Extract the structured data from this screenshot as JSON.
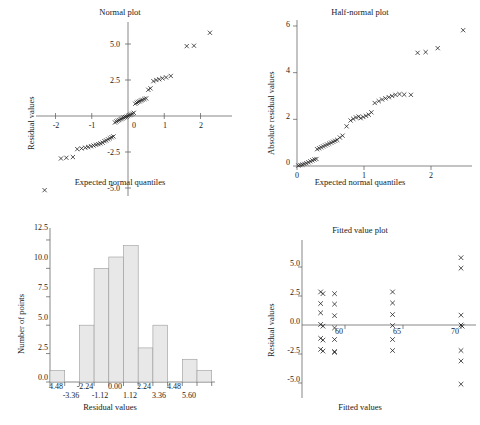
{
  "figure": {
    "panels": [
      {
        "id": "normal-plot",
        "title": "Normal plot",
        "xlabel": "Expected normal quantiles",
        "ylabel": "Residual values"
      },
      {
        "id": "half-normal-plot",
        "title": "Half-normal plot",
        "xlabel": "Expected normal quantiles",
        "ylabel": "Absolute residual values"
      },
      {
        "id": "histogram-plot",
        "title": "",
        "xlabel": "Residual values",
        "ylabel": "Number of points"
      },
      {
        "id": "fitted-value-plot",
        "title": "Fitted value plot",
        "xlabel": "Fitted values",
        "ylabel": "Residual values"
      }
    ]
  },
  "chart_data": [
    {
      "type": "scatter",
      "id": "normal-plot",
      "title": "Normal plot",
      "xlabel": "Expected normal quantiles",
      "ylabel": "Residual values",
      "xlim": [
        -2.6,
        2.6
      ],
      "ylim": [
        -5.6,
        6.2
      ],
      "xticks": [
        -2,
        -1,
        0,
        1,
        2
      ],
      "xtick_labels": [
        "-2",
        "-1",
        "0",
        "1",
        "2"
      ],
      "yticks": [
        -5.0,
        -2.5,
        0,
        2.5,
        5.0
      ],
      "ytick_labels": [
        "-5.0",
        "-2.5",
        "0",
        "2.5",
        "5.0"
      ],
      "grid": false,
      "legend": "none",
      "marker": "x",
      "x": [
        -2.3,
        -1.85,
        -1.7,
        -1.52,
        -1.4,
        -1.28,
        -1.18,
        -1.1,
        -1.02,
        -0.95,
        -0.88,
        -0.82,
        -0.76,
        -0.7,
        -0.65,
        -0.6,
        -0.55,
        -0.5,
        -0.45,
        -0.4,
        -0.36,
        -0.32,
        -0.28,
        -0.24,
        -0.2,
        -0.16,
        -0.12,
        -0.08,
        -0.04,
        0.0,
        0.04,
        0.08,
        0.12,
        0.16,
        0.2,
        0.24,
        0.28,
        0.32,
        0.36,
        0.4,
        0.45,
        0.5,
        0.56,
        0.62,
        0.7,
        0.78,
        0.86,
        0.95,
        1.05,
        1.18,
        1.62,
        1.82,
        2.26
      ],
      "y": [
        -5.15,
        -2.95,
        -2.9,
        -2.85,
        -2.3,
        -2.25,
        -2.2,
        -2.15,
        -2.1,
        -2.05,
        -2.0,
        -1.95,
        -1.9,
        -1.85,
        -1.75,
        -1.7,
        -1.62,
        -1.55,
        -1.48,
        -1.42,
        -0.45,
        -0.38,
        -0.32,
        -0.28,
        -0.22,
        -0.18,
        -0.12,
        -0.08,
        -0.04,
        0.02,
        0.06,
        0.1,
        0.16,
        0.22,
        0.85,
        0.92,
        0.98,
        1.02,
        1.08,
        1.12,
        1.18,
        1.22,
        1.82,
        1.92,
        2.42,
        2.5,
        2.55,
        2.62,
        2.68,
        2.78,
        4.85,
        4.88,
        5.78
      ]
    },
    {
      "type": "scatter",
      "id": "half-normal-plot",
      "title": "Half-normal plot",
      "xlabel": "Expected normal quantiles",
      "ylabel": "Absolute residual values",
      "xlim": [
        -0.1,
        2.75
      ],
      "ylim": [
        -0.2,
        6.4
      ],
      "xticks": [
        0,
        1,
        2
      ],
      "xtick_labels": [
        "0",
        "1",
        "2"
      ],
      "yticks": [
        0,
        2,
        4,
        6
      ],
      "ytick_labels": [
        "0",
        "2",
        "4",
        "6"
      ],
      "grid": false,
      "legend": "none",
      "marker": "x",
      "x": [
        0.02,
        0.05,
        0.08,
        0.11,
        0.14,
        0.17,
        0.2,
        0.23,
        0.26,
        0.29,
        0.3,
        0.33,
        0.36,
        0.39,
        0.42,
        0.45,
        0.48,
        0.51,
        0.54,
        0.57,
        0.6,
        0.64,
        0.68,
        0.74,
        0.8,
        0.84,
        0.88,
        0.92,
        0.95,
        0.99,
        1.03,
        1.07,
        1.11,
        1.16,
        1.22,
        1.27,
        1.32,
        1.37,
        1.42,
        1.47,
        1.53,
        1.6,
        1.7,
        1.8,
        1.92,
        2.1,
        2.48
      ],
      "y": [
        0.02,
        0.04,
        0.06,
        0.09,
        0.12,
        0.16,
        0.2,
        0.24,
        0.28,
        0.3,
        0.72,
        0.76,
        0.8,
        0.84,
        0.88,
        0.92,
        0.96,
        1.0,
        1.04,
        1.08,
        1.12,
        1.22,
        1.3,
        1.7,
        1.95,
        2.02,
        2.08,
        2.12,
        2.05,
        2.1,
        2.15,
        2.2,
        2.3,
        2.7,
        2.78,
        2.85,
        2.9,
        2.95,
        3.0,
        3.05,
        3.08,
        3.06,
        3.05,
        4.85,
        4.88,
        5.05,
        5.82
      ]
    },
    {
      "type": "bar",
      "id": "histogram-plot",
      "title": "",
      "xlabel": "Residual values",
      "ylabel": "Number of points",
      "categories": [
        "-4.48",
        "-3.36",
        "-2.24",
        "-1.12",
        "0.00",
        "1.12",
        "2.24",
        "3.36",
        "4.48",
        "5.60"
      ],
      "xtick_labels_row1": [
        "4.48",
        "-2.24",
        "0.00",
        "2.24",
        "4.48"
      ],
      "xtick_labels_row2": [
        "-3.36",
        "-1.12",
        "1.12",
        "3.36",
        "5.60"
      ],
      "values": [
        1,
        0,
        5,
        10,
        11,
        12,
        3,
        5,
        0,
        2,
        1
      ],
      "ylim": [
        0,
        13.2
      ],
      "yticks": [
        0.0,
        2.5,
        5.0,
        7.5,
        10.0,
        12.5
      ],
      "ytick_labels": [
        "0.0",
        "2.5",
        "5.0",
        "7.5",
        "10.0",
        "12.5"
      ],
      "grid": false,
      "legend": "none"
    },
    {
      "type": "scatter",
      "id": "fitted-value-plot",
      "title": "Fitted value plot",
      "xlabel": "Fitted values",
      "ylabel": "Residual values",
      "xlim": [
        56.6,
        71.6
      ],
      "ylim": [
        -6.0,
        6.4
      ],
      "xticks": [
        60,
        65,
        70
      ],
      "xtick_labels": [
        "60",
        "65",
        "70"
      ],
      "yticks": [
        -5.0,
        -2.5,
        0.0,
        2.5,
        5.0
      ],
      "ytick_labels": [
        "-5.0",
        "-2.5",
        "0.0",
        "2.5",
        "5.0"
      ],
      "grid": false,
      "legend": "none",
      "marker": "x",
      "zero_line": true,
      "x": [
        57.9,
        58.1,
        57.9,
        57.9,
        57.9,
        58.1,
        57.9,
        58.1,
        57.9,
        58.1,
        59.1,
        59.1,
        59.1,
        59.1,
        59.1,
        59.1,
        59.1,
        64.1,
        64.1,
        64.1,
        64.1,
        64.1,
        64.1,
        70.0,
        70.0,
        70.0,
        70.0,
        70.1,
        70.0,
        70.0,
        70.0
      ],
      "y": [
        2.85,
        2.7,
        1.85,
        1.05,
        0.05,
        -0.1,
        -1.15,
        -1.3,
        -2.1,
        -2.25,
        2.7,
        1.8,
        0.8,
        -0.25,
        -1.25,
        -2.3,
        -2.35,
        2.85,
        1.9,
        0.9,
        -0.05,
        -1.25,
        -2.2,
        5.8,
        4.9,
        0.85,
        0.0,
        -0.1,
        -2.2,
        -3.1,
        -5.1
      ]
    }
  ]
}
